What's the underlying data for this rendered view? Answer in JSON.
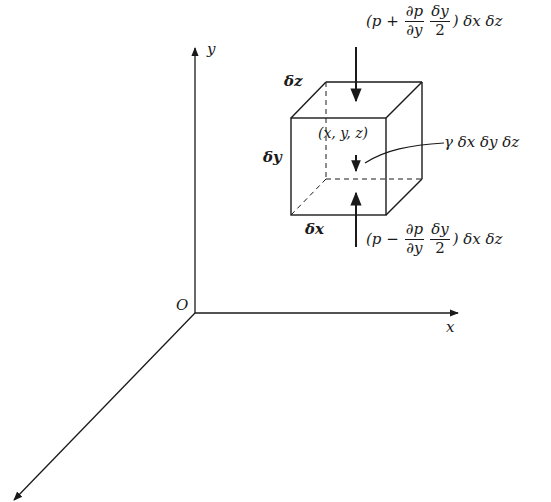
{
  "diagram": {
    "title": "",
    "colors": {
      "ink": "#1a1a1a",
      "background": "#ffffff"
    },
    "axes": {
      "origin_label": "O",
      "x_label": "x",
      "y_label": "y",
      "z_label": ""
    },
    "element": {
      "dx_label": "δx",
      "dy_label": "δy",
      "dz_label": "δz",
      "center_label": "(x, y, z)",
      "weight_label": "γ δx δy δz"
    },
    "top_force": {
      "open": "(p +",
      "frac1_num": "∂p",
      "frac1_den": "∂y",
      "frac2_num": "δy",
      "frac2_den": "2",
      "close": ") δx δz"
    },
    "bottom_force": {
      "open": "(p −",
      "frac1_num": "∂p",
      "frac1_den": "∂y",
      "frac2_num": "δy",
      "frac2_den": "2",
      "close": ") δx δz"
    }
  }
}
